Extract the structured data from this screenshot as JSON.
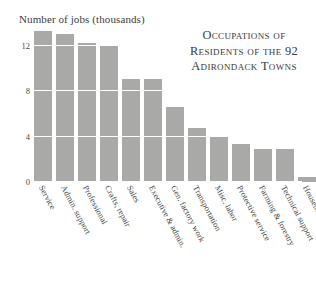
{
  "chart_data": {
    "type": "bar",
    "title": "Occupations of Residents of the 92 Adirondack Towns",
    "title_lines": [
      "Occupations of",
      "Residents of the 92",
      "Adirondack Towns"
    ],
    "xlabel": "",
    "ylabel": "Number of jobs (thousands)",
    "ylim": [
      0,
      13.6
    ],
    "yticks": [
      0,
      4,
      8,
      12
    ],
    "ytick_labels": [
      "0",
      "4",
      "8",
      "12"
    ],
    "grid": true,
    "grid_color": "#ffffff",
    "bar_color": "#a9a9a7",
    "legend": "none",
    "categories": [
      "Service",
      "Admin. support",
      "Professional",
      "Crafts, repair",
      "Sales",
      "Executive & admin.",
      "Gen. factory work",
      "Transportation",
      "Misc. labor",
      "Protective service",
      "Farming & forestry",
      "Technical support",
      "Household service"
    ],
    "values": [
      13.3,
      13.1,
      12.3,
      12.0,
      9.1,
      9.1,
      6.6,
      4.8,
      4.0,
      3.4,
      2.9,
      2.9,
      0.4
    ]
  },
  "axis": {
    "y_title": "Number of jobs (thousands)"
  }
}
